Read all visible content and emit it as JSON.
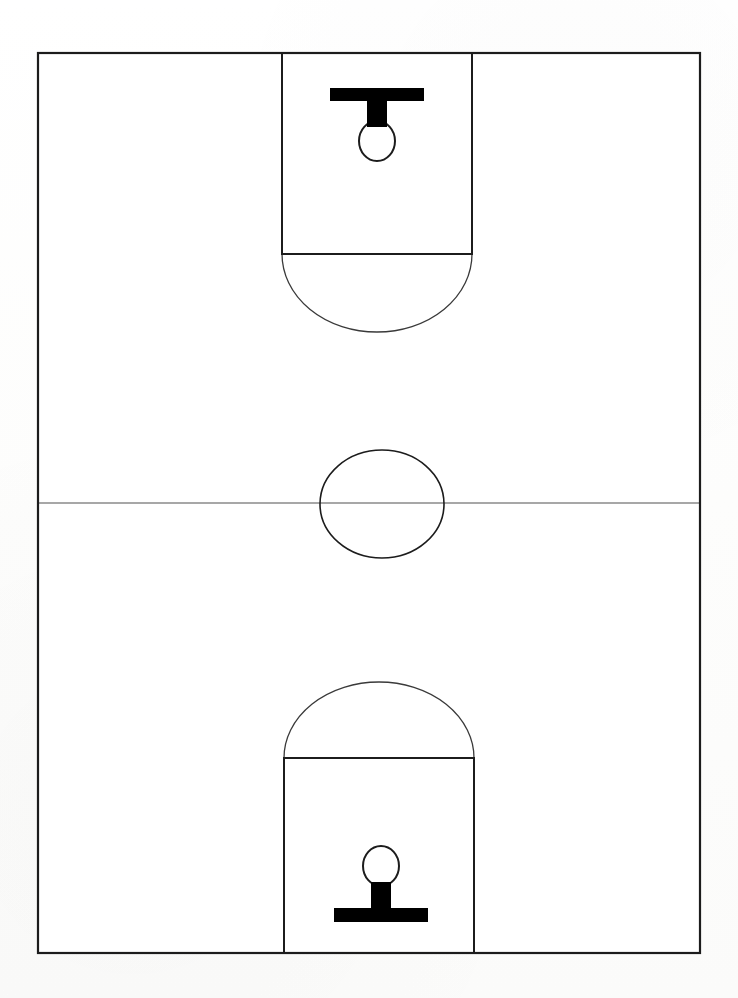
{
  "figure": {
    "orientation": "vertical",
    "view": "full-court-top-down",
    "canvas": {
      "width": 738,
      "height": 998
    },
    "background_color": "#fdfdfc",
    "line_color": "#1c1c1c",
    "thin_line_color": "#3a3a3a",
    "midcourt_line_color": "#8a8a8a",
    "fill_color": "#000000",
    "court_fill": "#ffffff"
  },
  "court": {
    "boundary": {
      "label": "court-boundary",
      "x": 38,
      "y": 53,
      "width": 662,
      "height": 900,
      "stroke_width": 2.2
    },
    "midcourt_line": {
      "label": "midcourt-line",
      "x1": 38,
      "y1": 503,
      "x2": 700,
      "y2": 503,
      "stroke_width": 1.4
    },
    "center_circle": {
      "label": "center-circle",
      "cx": 382,
      "cy": 504,
      "rx": 62,
      "ry": 54,
      "stroke_width": 1.6
    }
  },
  "top_half": {
    "label": "top-half-court",
    "key": {
      "label": "top-key-lane",
      "x": 282,
      "y": 53,
      "width": 190,
      "height": 201,
      "stroke_width": 2.0
    },
    "free_throw_line": {
      "label": "top-free-throw-line",
      "x1": 282,
      "y1": 254,
      "x2": 472,
      "y2": 254,
      "stroke_width": 2.0
    },
    "free_throw_arc": {
      "label": "top-free-throw-arc",
      "cx": 377,
      "cy": 254,
      "rx": 95,
      "ry": 78,
      "direction": "down",
      "stroke_width": 1.3
    },
    "backboard": {
      "label": "top-backboard",
      "x": 330,
      "y": 88,
      "width": 94,
      "height": 13
    },
    "stem": {
      "label": "top-hoop-stem",
      "x": 367,
      "y": 101,
      "width": 20,
      "height": 26
    },
    "hoop": {
      "label": "top-hoop-rim",
      "cx": 377,
      "cy": 141,
      "rx": 18,
      "ry": 20,
      "stroke_width": 2.0
    }
  },
  "bottom_half": {
    "label": "bottom-half-court",
    "key": {
      "label": "bottom-key-lane",
      "x": 284,
      "y": 758,
      "width": 190,
      "height": 195,
      "stroke_width": 2.0
    },
    "free_throw_line": {
      "label": "bottom-free-throw-line",
      "x1": 284,
      "y1": 758,
      "x2": 474,
      "y2": 758,
      "stroke_width": 2.0
    },
    "free_throw_arc": {
      "label": "bottom-free-throw-arc",
      "cx": 379,
      "cy": 758,
      "rx": 95,
      "ry": 76,
      "direction": "up",
      "stroke_width": 1.3
    },
    "backboard": {
      "label": "bottom-backboard",
      "x": 334,
      "y": 908,
      "width": 94,
      "height": 14
    },
    "stem": {
      "label": "bottom-hoop-stem",
      "x": 371,
      "y": 882,
      "width": 20,
      "height": 26
    },
    "hoop": {
      "label": "bottom-hoop-rim",
      "cx": 381,
      "cy": 866,
      "rx": 18,
      "ry": 20,
      "stroke_width": 2.0
    }
  }
}
